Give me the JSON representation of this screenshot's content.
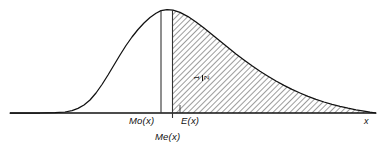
{
  "figure": {
    "type": "statistical-distribution-diagram",
    "background_color": "#ffffff",
    "line_color": "#111111",
    "hatch_color": "#555555"
  },
  "labels": {
    "mode": "Mo(x)",
    "expectation": "E(x)",
    "median": "Me(x)",
    "x_axis": "x",
    "area_numerator": "1",
    "area_denominator": "2"
  },
  "chart_data": {
    "type": "area",
    "title": "",
    "subtitle": "",
    "xlabel": "x",
    "ylabel": "",
    "grid": false,
    "legend": null,
    "axis": {
      "x_start_px": 10,
      "x_end_px": 376,
      "baseline_y_px": 113,
      "x_axis_tick_label": "x"
    },
    "curve_description": "right-skewed (positively skewed) unimodal probability density curve",
    "curve_points_px": [
      [
        10,
        113
      ],
      [
        40,
        113
      ],
      [
        55,
        112.6
      ],
      [
        65,
        112
      ],
      [
        72,
        110.6
      ],
      [
        78,
        108.4
      ],
      [
        84,
        105
      ],
      [
        90,
        100
      ],
      [
        96,
        93
      ],
      [
        102,
        84.5
      ],
      [
        108,
        75
      ],
      [
        114,
        65
      ],
      [
        120,
        55
      ],
      [
        126,
        45.5
      ],
      [
        132,
        37
      ],
      [
        138,
        29.5
      ],
      [
        144,
        23
      ],
      [
        150,
        17.5
      ],
      [
        156,
        13.2
      ],
      [
        161,
        10.6
      ],
      [
        167,
        9.6
      ],
      [
        173,
        10.2
      ],
      [
        180,
        12.4
      ],
      [
        188,
        16.6
      ],
      [
        196,
        22
      ],
      [
        204,
        28
      ],
      [
        212,
        34.4
      ],
      [
        220,
        41
      ],
      [
        228,
        47.5
      ],
      [
        236,
        54
      ],
      [
        244,
        60
      ],
      [
        252,
        65.8
      ],
      [
        260,
        71.2
      ],
      [
        268,
        76.2
      ],
      [
        276,
        81
      ],
      [
        284,
        85.4
      ],
      [
        292,
        89.4
      ],
      [
        300,
        93
      ],
      [
        308,
        96.4
      ],
      [
        316,
        99.4
      ],
      [
        324,
        102
      ],
      [
        332,
        104.4
      ],
      [
        340,
        106.4
      ],
      [
        348,
        108.2
      ],
      [
        356,
        109.8
      ],
      [
        364,
        111.2
      ],
      [
        370,
        112.2
      ],
      [
        376,
        113
      ]
    ],
    "markers": [
      {
        "name": "mode",
        "label": "Mo(x)",
        "x_px": 161,
        "type": "vertical-line",
        "top_y_px": 10.6,
        "bottom_y_px": 113
      },
      {
        "name": "median",
        "label": "Me(x)",
        "x_px": 172.5,
        "type": "vertical-line",
        "top_y_px": 10.1,
        "bottom_y_px": 113,
        "has_axis_tick": true
      },
      {
        "name": "expectation",
        "label": "E(x)",
        "x_px": 196,
        "type": "axis-label-only"
      }
    ],
    "shaded_region": {
      "name": "upper-half-area",
      "from_x_px": 172.5,
      "to_x_px": 376,
      "fill": "diagonal-hatch",
      "hatch_angle_deg": 45,
      "area_label": "1/2",
      "area_value": 0.5,
      "label_x_px": 203,
      "label_y_px": 72,
      "label_rotation_deg": -90
    },
    "ordering_note": "Mo(x) < Me(x) < E(x)"
  }
}
